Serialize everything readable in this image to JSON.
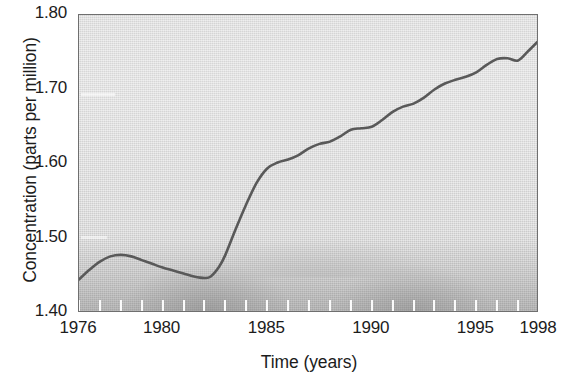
{
  "chart_data": {
    "type": "line",
    "title": "",
    "xlabel": "Time (years)",
    "ylabel": "Concentration (parts per million)",
    "xlim": [
      1976,
      1998
    ],
    "ylim": [
      1.4,
      1.8
    ],
    "grid": false,
    "legend": null,
    "x_tick_labels": [
      "1976",
      "1980",
      "1985",
      "1990",
      "1995",
      "1998"
    ],
    "x_tick_values": [
      1976,
      1980,
      1985,
      1990,
      1995,
      1998
    ],
    "x_minor_ticks": [
      1976,
      1977,
      1978,
      1979,
      1980,
      1981,
      1982,
      1983,
      1984,
      1985,
      1986,
      1987,
      1988,
      1989,
      1990,
      1991,
      1992,
      1993,
      1994,
      1995,
      1996,
      1997,
      1998
    ],
    "y_tick_labels": [
      "1.80",
      "1.70",
      "1.60",
      "1.50",
      "1.40"
    ],
    "y_tick_values": [
      1.8,
      1.7,
      1.6,
      1.5,
      1.4
    ],
    "series": [
      {
        "name": "Concentration",
        "color": "#595959",
        "x": [
          1976.0,
          1976.5,
          1977.0,
          1977.5,
          1978.0,
          1978.5,
          1979.0,
          1979.5,
          1980.0,
          1980.5,
          1981.0,
          1981.5,
          1982.0,
          1982.3,
          1982.7,
          1983.0,
          1983.5,
          1984.0,
          1984.5,
          1985.0,
          1985.5,
          1986.0,
          1986.5,
          1987.0,
          1987.5,
          1988.0,
          1988.5,
          1989.0,
          1989.5,
          1990.0,
          1990.5,
          1991.0,
          1991.5,
          1992.0,
          1992.5,
          1993.0,
          1993.5,
          1994.0,
          1994.5,
          1995.0,
          1995.5,
          1996.0,
          1996.5,
          1997.0,
          1997.5,
          1998.0
        ],
        "y": [
          1.445,
          1.458,
          1.469,
          1.476,
          1.478,
          1.476,
          1.471,
          1.466,
          1.461,
          1.457,
          1.453,
          1.449,
          1.447,
          1.449,
          1.462,
          1.478,
          1.513,
          1.546,
          1.575,
          1.594,
          1.602,
          1.606,
          1.612,
          1.621,
          1.627,
          1.63,
          1.637,
          1.646,
          1.648,
          1.65,
          1.659,
          1.67,
          1.677,
          1.681,
          1.689,
          1.7,
          1.708,
          1.713,
          1.717,
          1.723,
          1.733,
          1.741,
          1.742,
          1.739,
          1.752,
          1.766
        ]
      }
    ]
  },
  "axes": {
    "y_title": "Concentration (parts per million)",
    "x_title": "Time (years)"
  }
}
